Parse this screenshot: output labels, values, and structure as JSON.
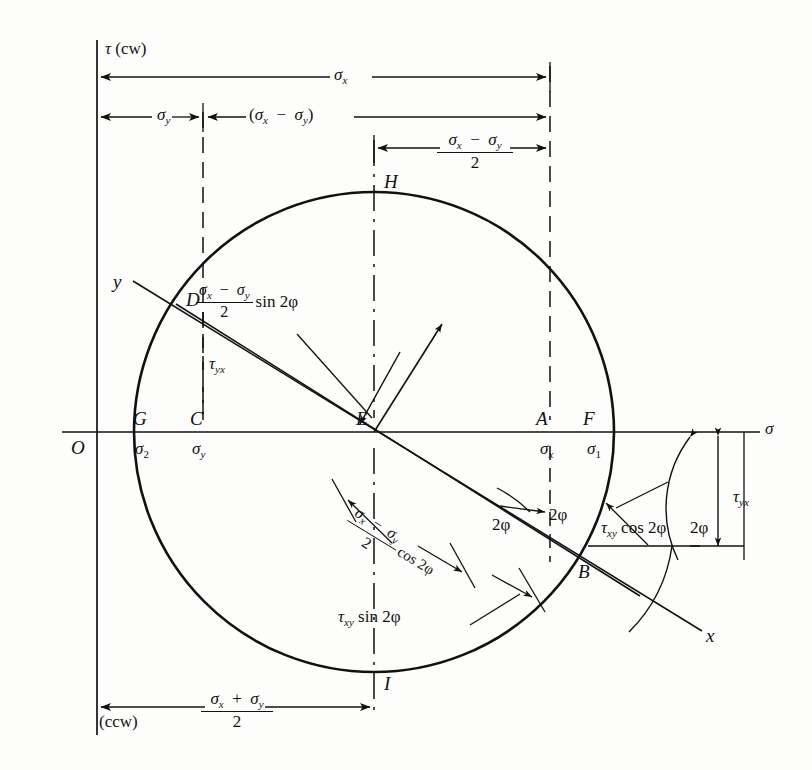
{
  "figure": {
    "type": "mohr-circle-stress-diagram",
    "background_color": "#fdfdfb",
    "line_color": "#111111"
  },
  "axes": {
    "vertical_axis_label": "τ (cw)",
    "vertical_axis_label_bottom": "(ccw)",
    "horizontal_axis_label": "σ",
    "origin_label": "O"
  },
  "points": {
    "O": "O",
    "G": "G",
    "C": "C",
    "D": "D",
    "E": "E",
    "A": "A",
    "F": "F",
    "H": "H",
    "I": "I",
    "B": "B"
  },
  "axis_ray_labels": {
    "y_axis_ray": "y",
    "x_axis_ray": "x"
  },
  "stress_value_labels": {
    "sigma_2": {
      "base": "σ",
      "sub": "2"
    },
    "sigma_y_at_C": {
      "base": "σ",
      "sub": "y"
    },
    "sigma_x_at_A": {
      "base": "σ",
      "sub": "x"
    },
    "sigma_1_at_F": {
      "base": "σ",
      "sub": "1"
    },
    "tau_yx_left": {
      "base": "τ",
      "sub": "yx"
    },
    "tau_yx_right": {
      "base": "τ",
      "sub": "yx"
    }
  },
  "dimension_labels": {
    "sigma_x_total": {
      "text": "σ",
      "sub": "x",
      "description": "full width from tau axis to vertical line at A"
    },
    "sigma_y_total": {
      "text": "σ",
      "sub": "y",
      "description": "from tau axis to vertical line at C"
    },
    "sigma_x_minus_sigma_y": {
      "text": "(σx − σy)",
      "description": "from C line to A line"
    },
    "half_difference": {
      "num": "σx − σy",
      "den": "2",
      "description": "from E line to A line"
    },
    "mean_stress": {
      "num": "σx + σy",
      "den": "2",
      "description": "from tau axis to E vertical line, at bottom"
    }
  },
  "component_labels": {
    "sin_term": {
      "num": "σx − σy",
      "den": "2",
      "tail": "sin 2ϕ"
    },
    "cos_term": {
      "num": "σx − σy",
      "den": "2",
      "tail": "cos 2ϕ"
    },
    "tau_xy_cos": {
      "base": "τ",
      "sub": "xy",
      "tail": "cos 2ϕ"
    },
    "tau_xy_sin": {
      "base": "τ",
      "sub": "xy",
      "tail": "sin 2ϕ"
    }
  },
  "angle_labels": {
    "two_phi_at_A": "2ϕ",
    "two_phi_at_B": "2ϕ",
    "two_phi_right": "2ϕ"
  },
  "geometry": {
    "center_E": {
      "x": 374,
      "y": 432
    },
    "radius": 240,
    "tau_axis_x": 97,
    "sigma_axis_y": 432,
    "point_A_x": 550,
    "point_F_x": 578,
    "point_G_x": 148,
    "point_C_x": 203,
    "point_H": {
      "x": 374,
      "y": 194
    },
    "point_I": {
      "x": 374,
      "y": 672
    },
    "point_D": {
      "x": 176,
      "y": 304
    },
    "point_B": {
      "x": 573,
      "y": 559
    }
  }
}
